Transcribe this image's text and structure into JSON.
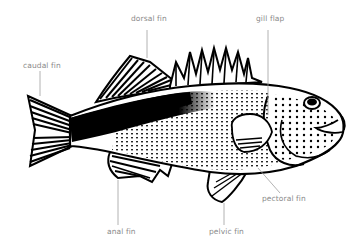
{
  "diagram": {
    "colors": {
      "ink": "#000000",
      "leader": "#9a9a9a",
      "label": "#8a8a8a",
      "background": "#ffffff"
    },
    "labels": [
      {
        "id": "dorsal-fin",
        "text": "dorsal fin",
        "x": 131,
        "y": 19
      },
      {
        "id": "gill-flap",
        "text": "gill flap",
        "x": 256,
        "y": 19
      },
      {
        "id": "caudal-fin",
        "text": "caudal fin",
        "x": 23,
        "y": 61
      },
      {
        "id": "pectoral-fin",
        "text": "pectoral fin",
        "x": 262,
        "y": 195
      },
      {
        "id": "anal-fin",
        "text": "anal fin",
        "x": 107,
        "y": 227
      },
      {
        "id": "pelvic-fin",
        "text": "pelvic fin",
        "x": 209,
        "y": 227
      }
    ]
  }
}
